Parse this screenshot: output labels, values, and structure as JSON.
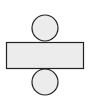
{
  "diagram": {
    "colors": {
      "background": "#ffffff",
      "fill": "#ececec",
      "stroke": "#222222"
    },
    "shapes": {
      "top_circle": {
        "cx": 45,
        "cy": 28,
        "r": 13
      },
      "rectangle": {
        "x": 6.5,
        "y": 42.5,
        "width": 77,
        "height": 26
      },
      "bottom_circle": {
        "cx": 45,
        "cy": 82,
        "r": 13
      }
    }
  }
}
